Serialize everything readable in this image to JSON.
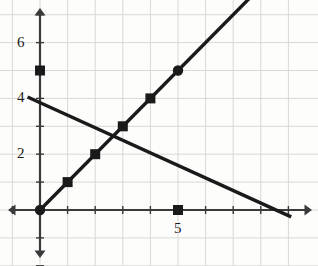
{
  "chart_data": {
    "type": "line",
    "title": "",
    "xlabel": "",
    "ylabel": "",
    "xlim": [
      -1.45,
      9.9
    ],
    "ylim": [
      -2.0,
      7.15
    ],
    "grid": true,
    "grid_step": 1,
    "axis_style": "double-arrow-cartesian",
    "x_ticks": [
      1,
      2,
      3,
      4,
      5,
      6,
      7,
      8,
      9
    ],
    "y_ticks": [
      1,
      2,
      3,
      4,
      5,
      6,
      7
    ],
    "x_tick_labels": [
      {
        "value": 5,
        "text": "5"
      }
    ],
    "y_tick_labels": [
      {
        "value": 2,
        "text": "2"
      },
      {
        "value": 4,
        "text": "4"
      },
      {
        "value": 6,
        "text": "6"
      }
    ],
    "series": [
      {
        "name": "rising-line",
        "equation": "y = x",
        "slope": 1,
        "intercept": 0,
        "x_start": 0,
        "x_end": 8.05,
        "marker": "square",
        "color": "#1a1a1a",
        "points": [
          {
            "x": 0,
            "y": 0,
            "marker": "circle"
          },
          {
            "x": 1,
            "y": 1,
            "marker": "square"
          },
          {
            "x": 2,
            "y": 2,
            "marker": "square"
          },
          {
            "x": 3,
            "y": 3,
            "marker": "square"
          },
          {
            "x": 4,
            "y": 4,
            "marker": "square"
          },
          {
            "x": 5,
            "y": 5,
            "marker": "circle"
          }
        ]
      },
      {
        "name": "falling-line",
        "equation": "y = 4 - 0.45x",
        "slope": -0.45,
        "intercept": 3.85,
        "x_start": -0.45,
        "x_end": 9.1,
        "marker": "none",
        "color": "#1a1a1a",
        "points": []
      }
    ],
    "extra_markers": [
      {
        "x": 0,
        "y": 5,
        "marker": "square",
        "color": "#1a1a1a"
      },
      {
        "x": 5,
        "y": 0,
        "marker": "square",
        "color": "#1a1a1a"
      }
    ],
    "intersection": {
      "x": 2.66,
      "y": 2.66
    },
    "colors": {
      "line": "#1a1a1a",
      "axis": "#3a3a3a",
      "grid": "#d8d8d4",
      "background": "#fdfdfc",
      "label": "#1a1a1a"
    }
  },
  "labels": {
    "y6": "6",
    "y4": "4",
    "y2": "2",
    "x5": "5"
  }
}
